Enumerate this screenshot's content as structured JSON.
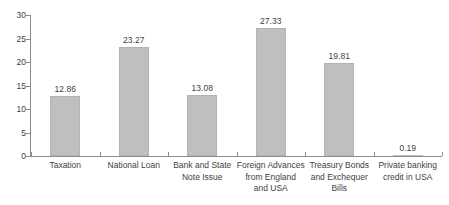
{
  "chart_data": {
    "type": "bar",
    "title": "",
    "subtitle": "",
    "xlabel": "",
    "ylabel": "",
    "categories": [
      "Taxation",
      "National Loan",
      "Bank and State Note Issue",
      "Foreign Advances from England and USA",
      "Treasury Bonds and Exchequer Bills",
      "Private banking credit in USA"
    ],
    "values": [
      12.86,
      23.27,
      13.08,
      27.33,
      19.81,
      0.19
    ],
    "data_labels": [
      "12.86",
      "23.27",
      "13.08",
      "27.33",
      "19.81",
      "0.19"
    ],
    "ylim": [
      0,
      30
    ],
    "yticks": [
      0,
      5,
      10,
      15,
      20,
      25,
      30
    ],
    "ytick_labels": [
      "0",
      "5",
      "10",
      "15",
      "20",
      "25",
      "30"
    ],
    "grid": false,
    "legend": false,
    "legend_position": "none",
    "bar_color": "#bfbfbf",
    "axis_color": "#8c8c8c",
    "text_color": "#3f3f3f",
    "background": "#ffffff"
  },
  "category_label_lines": [
    [
      "Taxation"
    ],
    [
      "National Loan"
    ],
    [
      "Bank and State",
      "Note Issue"
    ],
    [
      "Foreign Advances",
      "from England",
      "and USA"
    ],
    [
      "Treasury Bonds",
      "and Exchequer",
      "Bills"
    ],
    [
      "Private banking",
      "credit in USA"
    ]
  ]
}
